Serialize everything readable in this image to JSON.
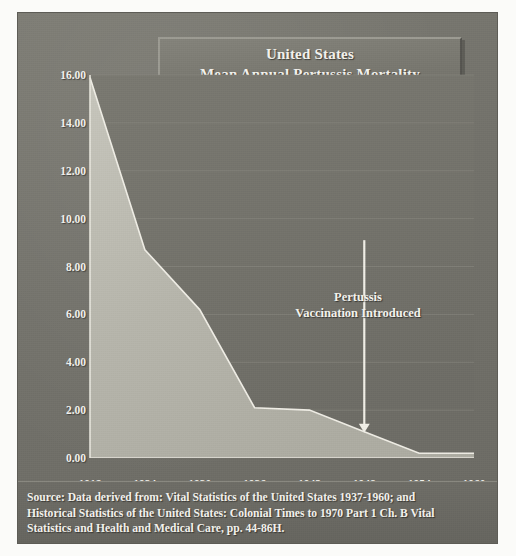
{
  "figure": {
    "title_lines": [
      "United States",
      "Mean Annual Pertussis Mortality",
      "Rates  Per 100,000 (1918-1960)"
    ],
    "annotation_lines": [
      "Pertussis",
      "Vaccination Introduced"
    ],
    "source_lines": [
      "Source: Data derived from: Vital Statistics of the United States 1937-1960; and",
      "Historical Statistics of the United States: Colonial Times to 1970 Part 1 Ch. B Vital",
      "Statistics and Health and Medical Care,  pp. 44-86H."
    ],
    "colors": {
      "panel_background": "#74736c",
      "area_fill": "#b9b8ae",
      "area_line": "#eceae2",
      "text": "#f4f3ee",
      "gridline": "#85847c",
      "axis_line": "#e8e6de"
    }
  },
  "chart_data": {
    "type": "area",
    "title": "United States Mean Annual Pertussis Mortality Rates Per 100,000 (1918-1960)",
    "xlabel": "",
    "ylabel": "",
    "x": [
      1918,
      1924,
      1930,
      1936,
      1942,
      1948,
      1954,
      1960
    ],
    "values": [
      15.9,
      8.7,
      6.2,
      2.1,
      2.0,
      1.1,
      0.2,
      0.2
    ],
    "xtick_labels": [
      "1918",
      "1924",
      "1930",
      "1936",
      "1942",
      "1948",
      "1954",
      "1960"
    ],
    "ytick_labels": [
      "0.00",
      "2.00",
      "4.00",
      "6.00",
      "8.00",
      "10.00",
      "12.00",
      "14.00",
      "16.00"
    ],
    "ytick_values": [
      0,
      2,
      4,
      6,
      8,
      10,
      12,
      14,
      16
    ],
    "xlim": [
      1918,
      1960
    ],
    "ylim": [
      0,
      16
    ],
    "grid": true,
    "legend": false,
    "annotations": [
      {
        "text": "Pertussis Vaccination Introduced",
        "x": 1948,
        "y": 1.1,
        "arrow": "down"
      }
    ]
  }
}
